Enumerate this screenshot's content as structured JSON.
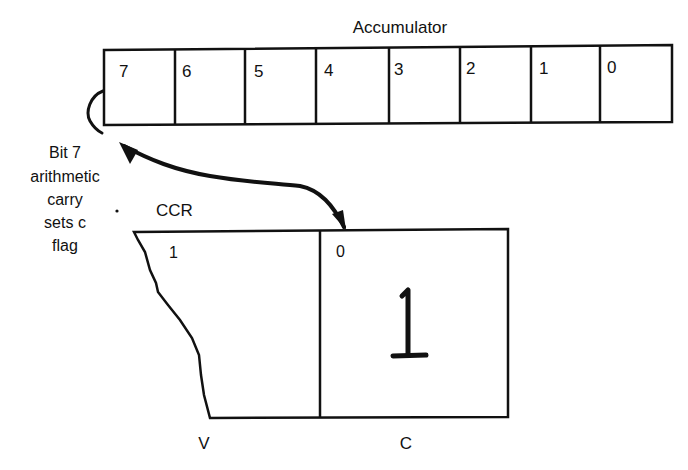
{
  "accumulator": {
    "title": "Accumulator",
    "bits": [
      "7",
      "6",
      "5",
      "4",
      "3",
      "2",
      "1",
      "0"
    ]
  },
  "annotation": {
    "lines": [
      "Bit 7",
      "arithmetic",
      "carry",
      "sets c",
      "flag"
    ]
  },
  "ccr": {
    "title": "CCR",
    "cells": [
      {
        "bit": "1",
        "flag": "V",
        "value": ""
      },
      {
        "bit": "0",
        "flag": "C",
        "value": "1"
      }
    ]
  },
  "colors": {
    "ink": "#111111",
    "background": "#ffffff"
  }
}
